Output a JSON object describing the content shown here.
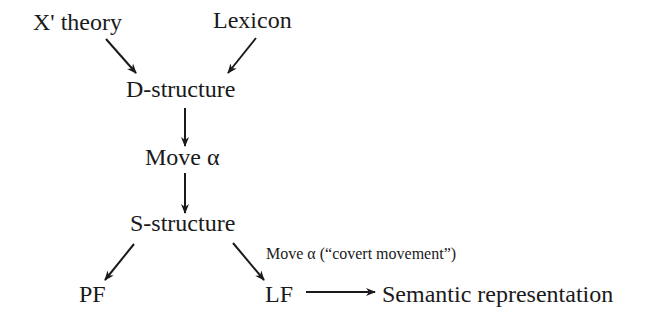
{
  "diagram": {
    "title": "",
    "nodes": {
      "xbar_theory": {
        "label": "X' theory"
      },
      "lexicon": {
        "label": "Lexicon"
      },
      "d_structure": {
        "label": "D-structure"
      },
      "move_alpha": {
        "label": "Move α"
      },
      "s_structure": {
        "label": "S-structure"
      },
      "pf": {
        "label": "PF"
      },
      "lf": {
        "label": "LF"
      },
      "semantic_representation": {
        "label": "Semantic representation"
      }
    },
    "edges": [
      {
        "from": "xbar_theory",
        "to": "d_structure",
        "label": ""
      },
      {
        "from": "lexicon",
        "to": "d_structure",
        "label": ""
      },
      {
        "from": "d_structure",
        "to": "move_alpha",
        "label": ""
      },
      {
        "from": "move_alpha",
        "to": "s_structure",
        "label": ""
      },
      {
        "from": "s_structure",
        "to": "pf",
        "label": ""
      },
      {
        "from": "s_structure",
        "to": "lf",
        "label": "Move α (“covert movement”)"
      },
      {
        "from": "lf",
        "to": "semantic_representation",
        "label": ""
      }
    ],
    "colors": {
      "ink": "#1a1a1a",
      "background": "#ffffff"
    }
  }
}
